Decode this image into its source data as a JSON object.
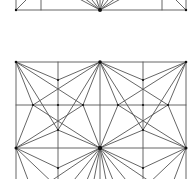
{
  "diagram": {
    "title": "",
    "width": 196,
    "height": 179,
    "background": "#ffffff",
    "line_color": "#555555",
    "node_color": "#111111",
    "panels": [
      {
        "name": "top-panel-partial",
        "description": "Bottom strip of an upper tiling panel (cut off by the image edge)",
        "edges": [
          [
            16,
            10,
            186,
            10
          ],
          [
            16,
            -5,
            16,
            10
          ],
          [
            41,
            -5,
            41,
            10
          ],
          [
            162,
            -5,
            162,
            10
          ],
          [
            186,
            -5,
            186,
            10
          ],
          [
            16,
            10,
            31,
            -5
          ],
          [
            186,
            10,
            171,
            -5
          ],
          [
            100,
            10,
            72,
            -5
          ],
          [
            100,
            10,
            80,
            -5
          ],
          [
            100,
            10,
            88,
            -5
          ],
          [
            100,
            10,
            95,
            -5
          ],
          [
            100,
            10,
            100,
            -5
          ],
          [
            100,
            10,
            105,
            -5
          ],
          [
            100,
            10,
            112,
            -5
          ],
          [
            100,
            10,
            120,
            -5
          ],
          [
            100,
            10,
            128,
            -5
          ]
        ],
        "nodes": [
          [
            16,
            10,
            1.2
          ],
          [
            100,
            10,
            2.0
          ],
          [
            186,
            10,
            1.2
          ]
        ]
      },
      {
        "name": "main-panel",
        "description": "Square grid 4x(>2) with radial star construction lines",
        "edges": [
          [
            16,
            62,
            186,
            62
          ],
          [
            16,
            105,
            186,
            105
          ],
          [
            16,
            148,
            186,
            148
          ],
          [
            16,
            62,
            16,
            185
          ],
          [
            58,
            62,
            58,
            185
          ],
          [
            100,
            62,
            100,
            185
          ],
          [
            143,
            62,
            143,
            185
          ],
          [
            186,
            62,
            186,
            185
          ],
          [
            16,
            62,
            58,
            80
          ],
          [
            100,
            62,
            58,
            80
          ],
          [
            100,
            62,
            143,
            80
          ],
          [
            186,
            62,
            143,
            80
          ],
          [
            16,
            62,
            33,
            105
          ],
          [
            16,
            62,
            83,
            105
          ],
          [
            16,
            62,
            58,
            130
          ],
          [
            100,
            62,
            83,
            105
          ],
          [
            100,
            62,
            33,
            105
          ],
          [
            100,
            62,
            58,
            130
          ],
          [
            100,
            62,
            118,
            105
          ],
          [
            100,
            62,
            168,
            105
          ],
          [
            100,
            62,
            143,
            130
          ],
          [
            186,
            62,
            168,
            105
          ],
          [
            186,
            62,
            118,
            105
          ],
          [
            186,
            62,
            143,
            130
          ],
          [
            16,
            148,
            33,
            105
          ],
          [
            16,
            148,
            83,
            105
          ],
          [
            16,
            148,
            58,
            130
          ],
          [
            100,
            148,
            83,
            105
          ],
          [
            100,
            148,
            33,
            105
          ],
          [
            100,
            148,
            58,
            130
          ],
          [
            100,
            148,
            118,
            105
          ],
          [
            100,
            148,
            168,
            105
          ],
          [
            100,
            148,
            143,
            130
          ],
          [
            186,
            148,
            168,
            105
          ],
          [
            186,
            148,
            118,
            105
          ],
          [
            186,
            148,
            143,
            130
          ],
          [
            16,
            148,
            58,
            168
          ],
          [
            100,
            148,
            58,
            168
          ],
          [
            100,
            148,
            143,
            168
          ],
          [
            186,
            148,
            143,
            168
          ],
          [
            16,
            148,
            30,
            185
          ],
          [
            16,
            148,
            55,
            185
          ],
          [
            100,
            148,
            45,
            185
          ],
          [
            100,
            148,
            70,
            185
          ],
          [
            100,
            148,
            85,
            185
          ],
          [
            100,
            148,
            93,
            185
          ],
          [
            100,
            148,
            107,
            185
          ],
          [
            100,
            148,
            115,
            185
          ],
          [
            100,
            148,
            130,
            185
          ],
          [
            100,
            148,
            155,
            185
          ],
          [
            186,
            148,
            172,
            185
          ],
          [
            186,
            148,
            147,
            185
          ]
        ],
        "nodes": [
          [
            16,
            62,
            1.3
          ],
          [
            100,
            62,
            1.8
          ],
          [
            186,
            62,
            1.3
          ],
          [
            58,
            80,
            1.1
          ],
          [
            143,
            80,
            1.1
          ],
          [
            33,
            105,
            1.1
          ],
          [
            58,
            105,
            1.1
          ],
          [
            83,
            105,
            1.1
          ],
          [
            118,
            105,
            1.1
          ],
          [
            143,
            105,
            1.1
          ],
          [
            168,
            105,
            1.1
          ],
          [
            58,
            130,
            1.1
          ],
          [
            143,
            130,
            1.1
          ],
          [
            16,
            148,
            1.5
          ],
          [
            100,
            148,
            2.2
          ],
          [
            186,
            148,
            1.5
          ],
          [
            58,
            168,
            1.1
          ],
          [
            143,
            168,
            1.1
          ]
        ]
      }
    ]
  }
}
